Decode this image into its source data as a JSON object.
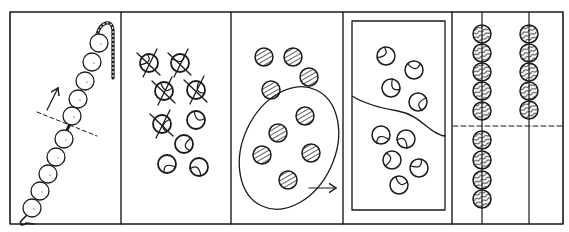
{
  "header": {
    "cut_off_text": "·····"
  },
  "figure": {
    "type": "hand-drawn illustration strip",
    "panel_count": 5,
    "ink_color": "#1a1a1a",
    "background": "#ffffff",
    "frame": {
      "x": 10,
      "y": 12,
      "width": 553,
      "height": 212
    },
    "dividers_x": [
      121,
      231,
      343,
      452
    ],
    "panels": [
      {
        "id": "panel-1",
        "label": "bead chain with dashed cut line and upward arrow",
        "beads": [
          [
            99,
            43
          ],
          [
            92,
            62
          ],
          [
            85,
            81
          ],
          [
            78,
            99
          ],
          [
            72,
            116
          ],
          [
            64,
            139
          ],
          [
            56,
            157
          ],
          [
            48,
            174
          ],
          [
            40,
            191
          ],
          [
            32,
            208
          ]
        ],
        "bead_radius": 9,
        "dashed_line": [
          [
            37,
            112
          ],
          [
            97,
            136
          ]
        ],
        "arrow": {
          "from": [
            47,
            110
          ],
          "to": [
            58,
            88
          ]
        }
      },
      {
        "id": "panel-2",
        "label": "balls, some crossed out",
        "crossed_balls": [
          [
            149,
            63
          ],
          [
            180,
            63
          ],
          [
            164,
            91
          ],
          [
            196,
            90
          ],
          [
            162,
            124
          ]
        ],
        "plain_balls": [
          [
            196,
            120
          ],
          [
            184,
            144
          ],
          [
            167,
            164
          ],
          [
            199,
            167
          ]
        ],
        "ball_radius": 9
      },
      {
        "id": "panel-3",
        "label": "hatched balls, group circled with arrow",
        "balls": [
          [
            264,
            57
          ],
          [
            293,
            57
          ],
          [
            309,
            77
          ],
          [
            271,
            90
          ],
          [
            305,
            116
          ],
          [
            278,
            133
          ],
          [
            262,
            155
          ],
          [
            311,
            153
          ],
          [
            288,
            180
          ]
        ],
        "ball_radius": 9,
        "ellipse": {
          "cx": 289,
          "cy": 148,
          "rx": 46,
          "ry": 64,
          "rotate": 25
        },
        "arrow": {
          "from": [
            309,
            188
          ],
          "to": [
            336,
            188
          ]
        }
      },
      {
        "id": "panel-4",
        "label": "tray divided by wavy line",
        "tray": {
          "x": 352,
          "y": 21,
          "width": 93,
          "height": 189
        },
        "balls": [
          [
            386,
            56
          ],
          [
            414,
            70
          ],
          [
            391,
            88
          ],
          [
            418,
            102
          ],
          [
            381,
            135
          ],
          [
            406,
            139
          ],
          [
            392,
            160
          ],
          [
            419,
            168
          ],
          [
            399,
            185
          ]
        ],
        "ball_radius": 9
      },
      {
        "id": "panel-5",
        "label": "abacus-like rods with striped beads and dashed line",
        "rods_x": [
          482,
          529
        ],
        "dashed_line_y": 126,
        "left_rod_beads_y": [
          34,
          53,
          72,
          91,
          111,
          140,
          160,
          180,
          199
        ],
        "right_rod_beads_y": [
          34,
          53,
          72,
          91,
          110
        ],
        "bead_radius": 9
      }
    ]
  }
}
